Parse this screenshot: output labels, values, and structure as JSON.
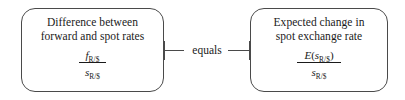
{
  "diagram": {
    "title_text_visible": false,
    "boxes": [
      {
        "id": "difference-box",
        "caption_line1": "Difference between",
        "caption_line2": "forward and spot rates",
        "formula": {
          "numerator_symbol": "f",
          "numerator_subscript": "R/$",
          "denominator_symbol": "s",
          "denominator_subscript": "R/$",
          "numerator_prefix": "",
          "numerator_suffix": ""
        }
      },
      {
        "id": "expected-change-box",
        "caption_line1": "Expected change in",
        "caption_line2": "spot exchange rate",
        "formula": {
          "numerator_symbol": "E",
          "numerator_prefix": "(",
          "numerator_inner_symbol": "s",
          "numerator_subscript": "R/$",
          "numerator_suffix": ")",
          "denominator_symbol": "s",
          "denominator_subscript": "R/$"
        }
      }
    ],
    "connector": {
      "label": "equals"
    },
    "colors": {
      "box_border": "#4a4a4a",
      "text": "#1a1a1a",
      "background": "#ffffff",
      "connector_line": "#4a4a4a"
    }
  }
}
